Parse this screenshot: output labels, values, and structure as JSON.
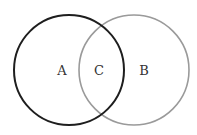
{
  "diagram": {
    "type": "venn",
    "sets": [
      {
        "id": "A",
        "label": "A",
        "cx": 69,
        "cy": 70,
        "r": 55,
        "stroke": "#1e1e1e",
        "stroke_width": 2
      },
      {
        "id": "B",
        "label": "B",
        "cx": 134,
        "cy": 70,
        "r": 55,
        "stroke": "#9a9a9a",
        "stroke_width": 1.6
      }
    ],
    "labels": {
      "a": {
        "text": "A",
        "x": 62,
        "y": 75
      },
      "c": {
        "text": "C",
        "x": 99,
        "y": 75
      },
      "b": {
        "text": "B",
        "x": 144,
        "y": 75
      }
    }
  }
}
